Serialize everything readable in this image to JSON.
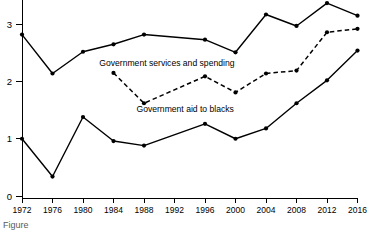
{
  "chart_data": {
    "type": "line",
    "title": "",
    "subtitle": "",
    "xlabel": "",
    "ylabel": "",
    "x": [
      1972,
      1976,
      1980,
      1984,
      1988,
      1992,
      1996,
      2000,
      2004,
      2008,
      2012,
      2016
    ],
    "xtick_labels": [
      "1972",
      "1976",
      "1980",
      "1984",
      "1988",
      "1992",
      "1996",
      "2000",
      "2004",
      "2008",
      "2012",
      "2016"
    ],
    "ytick_labels": [
      "0",
      "1",
      "2",
      "3"
    ],
    "ytick_values": [
      0,
      1,
      2,
      3
    ],
    "xlim": [
      1972,
      2016
    ],
    "ylim": [
      0,
      3.4
    ],
    "grid": false,
    "legend_position": "inline-annotations",
    "series": [
      {
        "name": "Government services and spending",
        "style": "solid",
        "marker": "filled-circle",
        "color": "#000000",
        "x": [
          1972,
          1976,
          1980,
          1984,
          1988,
          1996,
          2000,
          2004,
          2008,
          2012,
          2016
        ],
        "values": [
          2.82,
          2.14,
          2.52,
          2.65,
          2.82,
          2.73,
          2.51,
          3.17,
          2.97,
          3.37,
          3.15
        ]
      },
      {
        "name": "Government services and spending (dashed)",
        "style": "dashed",
        "marker": "filled-circle",
        "color": "#000000",
        "x": [
          1984,
          1988,
          1996,
          2000,
          2004,
          2008,
          2012,
          2016
        ],
        "values": [
          2.15,
          1.62,
          2.09,
          1.81,
          2.14,
          2.19,
          2.86,
          2.92
        ]
      },
      {
        "name": "Government aid to blacks",
        "style": "solid",
        "marker": "filled-circle",
        "color": "#000000",
        "x": [
          1972,
          1976,
          1980,
          1984,
          1988,
          1996,
          2000,
          2004,
          2008,
          2012,
          2016
        ],
        "values": [
          1.0,
          0.34,
          1.38,
          0.96,
          0.88,
          1.26,
          1.0,
          1.18,
          1.62,
          2.02,
          2.54
        ]
      }
    ],
    "annotations": [
      {
        "name": "services-and-spending-label",
        "text": "Government services and spending",
        "x": 1991.0,
        "y": 2.27
      },
      {
        "name": "aid-to-blacks-label",
        "text": "Government aid to blacks",
        "x": 1993.4,
        "y": 1.47
      }
    ]
  },
  "caption": {
    "fragment": "Figure"
  }
}
